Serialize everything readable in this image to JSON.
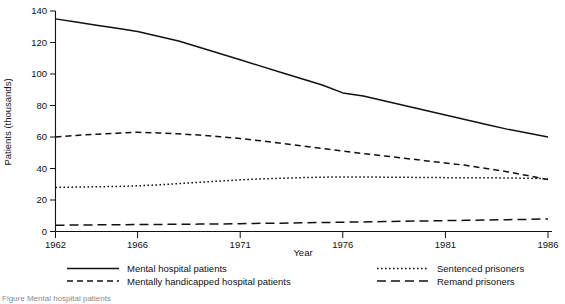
{
  "figure": {
    "caption_partial": "Figure    Mental hospital patients"
  },
  "chart_data": {
    "type": "line",
    "title": "",
    "xlabel": "Year",
    "ylabel": "Patients (thousands)",
    "xlim": [
      1962,
      1986
    ],
    "ylim": [
      0,
      140
    ],
    "xticks": [
      1962,
      1966,
      1971,
      1976,
      1981,
      1986
    ],
    "xticklabels": [
      "1962",
      "1966",
      "1971",
      "1976",
      "1981",
      "1986"
    ],
    "yticks": [
      0,
      20,
      40,
      60,
      80,
      100,
      120,
      140
    ],
    "yticklabels": [
      "0",
      "20",
      "40",
      "60",
      "80",
      "100",
      "120",
      "140"
    ],
    "grid": false,
    "legend_position": "below-axes",
    "x": [
      1962,
      1963,
      1964,
      1965,
      1966,
      1967,
      1968,
      1969,
      1970,
      1971,
      1972,
      1973,
      1974,
      1975,
      1976,
      1977,
      1978,
      1979,
      1980,
      1981,
      1982,
      1983,
      1984,
      1985,
      1986
    ],
    "series": [
      {
        "name": "Mental hospital patients",
        "dash": "solid",
        "values": [
          135,
          133,
          131,
          129,
          127,
          124,
          121,
          117,
          113,
          109,
          105,
          101,
          97,
          93,
          88,
          86,
          83,
          80,
          77,
          74,
          71,
          68,
          65,
          62.5,
          60
        ]
      },
      {
        "name": "Mentally handicapped hospital patients",
        "dash": "dashed",
        "values": [
          60,
          61,
          61.8,
          62.4,
          63,
          62.6,
          62,
          61.2,
          60.2,
          59,
          57.6,
          56,
          54.4,
          52.8,
          51,
          49.5,
          48,
          46.5,
          45,
          43.5,
          42,
          40,
          38,
          35.5,
          33
        ]
      },
      {
        "name": "Sentenced prisoners",
        "dash": "dotted",
        "values": [
          28,
          28.2,
          28.4,
          28.6,
          29,
          29.6,
          30.4,
          31.2,
          32,
          32.8,
          33.4,
          33.8,
          34.2,
          34.5,
          34.6,
          34.6,
          34.5,
          34.4,
          34.3,
          34.2,
          34.2,
          34.1,
          34,
          33.8,
          33.5
        ]
      },
      {
        "name": "Remand prisoners",
        "dash": "longdash",
        "values": [
          4,
          4.1,
          4.2,
          4.3,
          4.4,
          4.5,
          4.6,
          4.7,
          4.8,
          5,
          5.2,
          5.3,
          5.5,
          5.7,
          5.9,
          6.1,
          6.3,
          6.5,
          6.7,
          6.9,
          7.1,
          7.3,
          7.5,
          7.7,
          8
        ]
      }
    ]
  },
  "legend": {
    "entries": [
      {
        "label": "Mental hospital patients",
        "style": "solid"
      },
      {
        "label": "Mentally handicapped hospital patients",
        "style": "dashed"
      },
      {
        "label": "Sentenced prisoners",
        "style": "dotted"
      },
      {
        "label": "Remand prisoners",
        "style": "longdash"
      }
    ]
  },
  "colors": {
    "ink": "#111111",
    "background": "#ffffff"
  }
}
